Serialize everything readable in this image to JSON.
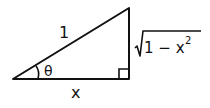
{
  "diagram": {
    "type": "right-triangle",
    "labels": {
      "hypotenuse": "1",
      "angle": "θ",
      "adjacent": "x",
      "opposite_radicand": "1 − x",
      "opposite_exponent": "2"
    },
    "stroke_color": "#111111",
    "background": "#ffffff"
  }
}
